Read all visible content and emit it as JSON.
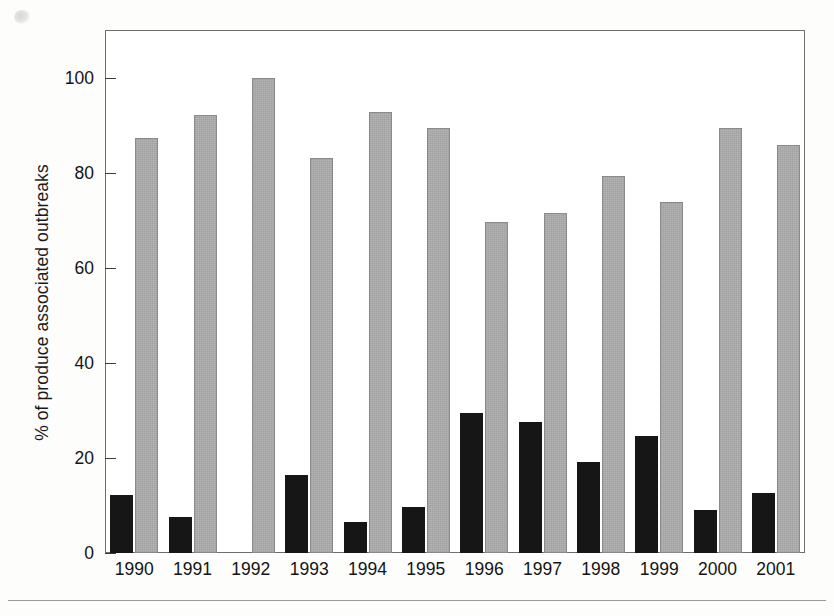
{
  "figure": {
    "caption": "",
    "background_color": "#ffffff"
  },
  "axes": {
    "y_title": "% of produce associated outbreaks",
    "y_ticks": [
      "0",
      "20",
      "40",
      "60",
      "80",
      "100"
    ],
    "x_title": ""
  },
  "colors": {
    "series_dark": "#161616",
    "series_light": "#b4b4b4",
    "frame": "#6e6e6e",
    "text": "#141414"
  },
  "chart_data": {
    "type": "bar",
    "title": "",
    "xlabel": "",
    "ylabel": "% of produce associated outbreaks",
    "ylim": [
      0,
      110
    ],
    "yticks": [
      0,
      20,
      40,
      60,
      80,
      100
    ],
    "grid": false,
    "legend": false,
    "categories": [
      "1990",
      "1991",
      "1992",
      "1993",
      "1994",
      "1995",
      "1996",
      "1997",
      "1998",
      "1999",
      "2000",
      "2001"
    ],
    "series": [
      {
        "name": "dark",
        "color": "#161616",
        "values": [
          12.3,
          7.5,
          0,
          16.4,
          6.5,
          9.7,
          29.4,
          27.5,
          19.2,
          24.6,
          9.1,
          12.6
        ]
      },
      {
        "name": "light",
        "color": "#b4b4b4",
        "values": [
          87.3,
          92.2,
          100,
          83.2,
          92.8,
          89.5,
          69.7,
          71.6,
          79.4,
          74.0,
          89.4,
          85.8
        ]
      }
    ]
  }
}
